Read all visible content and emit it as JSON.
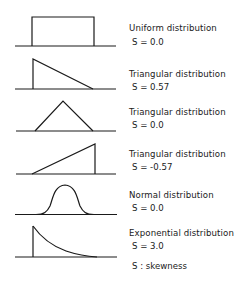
{
  "distributions": [
    {
      "name": "Uniform distribution",
      "skew_label": "S = 0.0",
      "shape": "uniform",
      "skewness": 0.0
    },
    {
      "name": "Triangular distribution",
      "skew_label": "S = 0.57",
      "shape": "right-triangle-left",
      "skewness": 0.57
    },
    {
      "name": "Triangular distribution",
      "skew_label": "S = 0.0",
      "shape": "isosceles-triangle",
      "skewness": 0.0
    },
    {
      "name": "Triangular distribution",
      "skew_label": "S = -0.57",
      "shape": "right-triangle-right",
      "skewness": -0.57
    },
    {
      "name": "Normal distribution",
      "skew_label": "S = 0.0",
      "shape": "bell-curve",
      "skewness": 0.0
    },
    {
      "name": "Exponential distribution",
      "skew_label": "S = 3.0",
      "shape": "exponential-decay",
      "skewness": 3.0
    }
  ],
  "legend": "S : skewness",
  "colors": {
    "line": "#1a1a1a",
    "background": "#ffffff"
  }
}
